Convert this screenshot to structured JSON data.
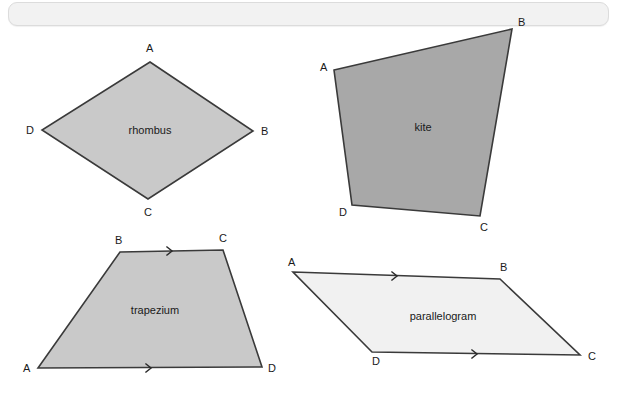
{
  "page": {
    "background_color": "#ffffff"
  },
  "top_bar": {
    "label": "",
    "fill_color": "#f2f2f2",
    "border_color": "#dcdcdc"
  },
  "figures": [
    {
      "id": "rhombus",
      "name": "rhombus",
      "label": "rhombus",
      "fill_color": "#c9c9c9",
      "stroke_color": "#3a3a3a",
      "points": "150,62 253,131 148,199 42,130",
      "label_x": 150,
      "label_y": 134,
      "vertices": [
        {
          "key": "A",
          "label": "A",
          "x": 146,
          "y": 52
        },
        {
          "key": "B",
          "label": "B",
          "x": 261,
          "y": 135
        },
        {
          "key": "C",
          "label": "C",
          "x": 144,
          "y": 216
        },
        {
          "key": "D",
          "label": "D",
          "x": 26,
          "y": 134
        }
      ],
      "markers": []
    },
    {
      "id": "kite",
      "name": "kite",
      "label": "kite",
      "fill_color": "#a8a8a8",
      "stroke_color": "#3a3a3a",
      "points": "334,70 512,29 480,216 352,205",
      "label_x": 423,
      "label_y": 131,
      "vertices": [
        {
          "key": "A",
          "label": "A",
          "x": 320,
          "y": 71
        },
        {
          "key": "B",
          "label": "B",
          "x": 518,
          "y": 26
        },
        {
          "key": "C",
          "label": "C",
          "x": 480,
          "y": 231
        },
        {
          "key": "D",
          "label": "D",
          "x": 339,
          "y": 216
        }
      ],
      "markers": []
    },
    {
      "id": "trapezium",
      "name": "trapezium",
      "label": "trapezium",
      "fill_color": "#c9c9c9",
      "stroke_color": "#3a3a3a",
      "points": "120,252 223,250 262,367 38,368",
      "label_x": 155,
      "label_y": 314,
      "vertices": [
        {
          "key": "B",
          "label": "B",
          "x": 115,
          "y": 244
        },
        {
          "key": "C",
          "label": "C",
          "x": 219,
          "y": 242
        },
        {
          "key": "D",
          "label": "D",
          "x": 268,
          "y": 372
        },
        {
          "key": "A",
          "label": "A",
          "x": 23,
          "y": 372
        }
      ],
      "markers": [
        {
          "edge": "BC",
          "shape": "chevron-right",
          "x": 171,
          "y": 251,
          "count": 1
        },
        {
          "edge": "AD",
          "shape": "chevron-right",
          "x": 150,
          "y": 368,
          "count": 1
        }
      ]
    },
    {
      "id": "parallelogram",
      "name": "parallelogram",
      "label": "parallelogram",
      "fill_color": "#f1f1f1",
      "stroke_color": "#3a3a3a",
      "points": "293,272 500,279 580,355 372,352",
      "label_x": 443,
      "label_y": 320,
      "vertices": [
        {
          "key": "A",
          "label": "A",
          "x": 288,
          "y": 266
        },
        {
          "key": "B",
          "label": "B",
          "x": 500,
          "y": 271
        },
        {
          "key": "C",
          "label": "C",
          "x": 588,
          "y": 360
        },
        {
          "key": "D",
          "label": "D",
          "x": 372,
          "y": 365
        }
      ],
      "markers": [
        {
          "edge": "AB",
          "shape": "chevron-right",
          "x": 396,
          "y": 276,
          "count": 1
        },
        {
          "edge": "DC",
          "shape": "chevron-right",
          "x": 476,
          "y": 354,
          "count": 1
        }
      ]
    }
  ]
}
